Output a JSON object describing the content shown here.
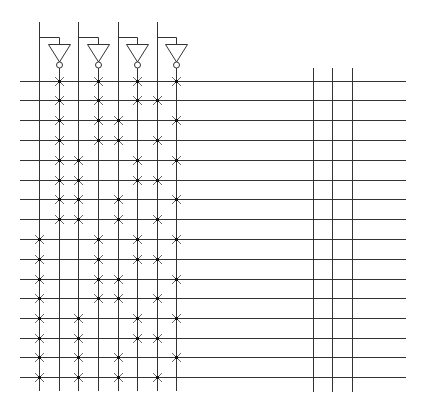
{
  "diagram": {
    "type": "PLA AND-plane",
    "colors": {
      "line": "#333333",
      "dot": "#111111",
      "mark": "#666666",
      "background": "#ffffff"
    },
    "inputs": [
      {
        "name": "input-1",
        "true_x": 39,
        "comp_x": 59
      },
      {
        "name": "input-2",
        "true_x": 78,
        "comp_x": 98
      },
      {
        "name": "input-3",
        "true_x": 118,
        "comp_x": 137
      },
      {
        "name": "input-4",
        "true_x": 157,
        "comp_x": 176
      }
    ],
    "columns_x": [
      39,
      59,
      78,
      98,
      118,
      137,
      157,
      176
    ],
    "output_columns_x": [
      313,
      332,
      352
    ],
    "rows_y": [
      81,
      100,
      120,
      140,
      160,
      180,
      199,
      219,
      239,
      259,
      279,
      298,
      318,
      338,
      357,
      377
    ],
    "row_x_range": [
      20,
      406
    ],
    "column_y_range": [
      22,
      391
    ],
    "output_column_y_range": [
      68,
      392
    ],
    "crosspoints": [
      [
        59,
        98,
        137,
        176
      ],
      [
        59,
        98,
        137,
        157
      ],
      [
        59,
        98,
        118,
        176
      ],
      [
        59,
        98,
        118,
        157
      ],
      [
        59,
        78,
        137,
        176
      ],
      [
        59,
        78,
        137,
        157
      ],
      [
        59,
        78,
        118,
        176
      ],
      [
        59,
        78,
        118,
        157
      ],
      [
        39,
        98,
        137,
        176
      ],
      [
        39,
        98,
        137,
        157
      ],
      [
        39,
        98,
        118,
        176
      ],
      [
        39,
        98,
        118,
        157
      ],
      [
        39,
        78,
        137,
        176
      ],
      [
        39,
        78,
        137,
        157
      ],
      [
        39,
        78,
        118,
        176
      ],
      [
        39,
        78,
        118,
        157
      ]
    ]
  }
}
